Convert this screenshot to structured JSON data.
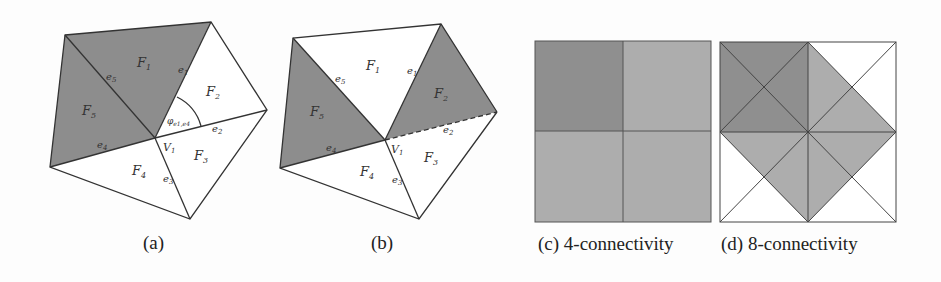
{
  "figure": {
    "panels": [
      {
        "id": "a",
        "caption": "(a)",
        "faces": [
          "F1",
          "F2",
          "F3",
          "F4",
          "F5"
        ],
        "edges": [
          "e1",
          "e2",
          "e3",
          "e4",
          "e5"
        ],
        "vertex": "V1",
        "angle_label": "φe1,e4",
        "shaded_faces": [
          "F1",
          "F5"
        ]
      },
      {
        "id": "b",
        "caption": "(b)",
        "faces": [
          "F1",
          "F2",
          "F3",
          "F4",
          "F5"
        ],
        "edges": [
          "e1",
          "e2",
          "e3",
          "e4",
          "e5"
        ],
        "vertex": "V1",
        "shaded_faces": [
          "F2",
          "F5"
        ],
        "dashed_edge": "e2"
      },
      {
        "id": "c",
        "caption": "(c) 4-connectivity"
      },
      {
        "id": "d",
        "caption": "(d) 8-connectivity"
      }
    ],
    "labels": {
      "F1": "F",
      "F1s": "1",
      "F2": "F",
      "F2s": "2",
      "F3": "F",
      "F3s": "3",
      "F4": "F",
      "F4s": "4",
      "F5": "F",
      "F5s": "5",
      "e1": "e",
      "e1s": "1",
      "e2": "e",
      "e2s": "2",
      "e3": "e",
      "e3s": "3",
      "e4": "e",
      "e4s": "4",
      "e5": "e",
      "e5s": "5",
      "V": "V",
      "Vs": "1",
      "phi": "φ",
      "phis": "e1,e4"
    },
    "colors": {
      "dark_fill": "#8a8a8a",
      "mid_fill": "#ababab",
      "stroke": "#333333",
      "background": "#fdfdfd"
    }
  }
}
